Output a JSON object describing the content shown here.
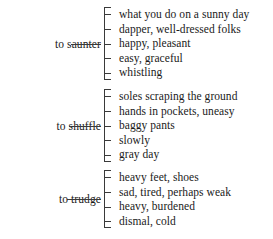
{
  "diagram": {
    "type": "bracket-list",
    "title": "",
    "groups": [
      {
        "label": "to saunter",
        "items": [
          "what you do on a sunny day",
          "dapper, well-dressed folks",
          "happy, pleasant",
          "easy, graceful",
          "whistling"
        ]
      },
      {
        "label": "to shuffle",
        "items": [
          "soles scraping the ground",
          "hands in pockets, uneasy",
          "baggy pants",
          "slowly",
          "gray day"
        ]
      },
      {
        "label": "to trudge",
        "items": [
          "heavy feet, shoes",
          "sad, tired, perhaps weak",
          "heavy, burdened",
          "dismal, cold"
        ]
      }
    ]
  },
  "colors": {
    "background": "#ffffff",
    "text": "#1a1a1a",
    "rule": "#3a3a3a"
  }
}
